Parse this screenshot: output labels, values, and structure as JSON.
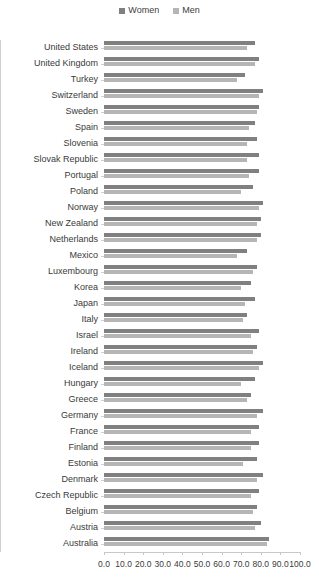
{
  "legend": {
    "position": "top-center",
    "entries": [
      {
        "label": "Women",
        "color": "#808080",
        "marker": "square-swatch"
      },
      {
        "label": "Men",
        "color": "#b5b5b5",
        "marker": "square-swatch"
      }
    ]
  },
  "axis": {
    "x_ticks": [
      "0.0",
      "10.0",
      "20.0",
      "30.0",
      "40.0",
      "50.0",
      "60.0",
      "70.0",
      "80.0",
      "90.0",
      "100.0"
    ]
  },
  "chart_data": {
    "type": "bar",
    "orientation": "horizontal",
    "title": "",
    "subtitle": "",
    "xlabel": "",
    "ylabel": "",
    "xlim": [
      0,
      100
    ],
    "xticks": [
      0,
      10,
      20,
      30,
      40,
      50,
      60,
      70,
      80,
      90,
      100
    ],
    "grid": false,
    "legend_position": "top-center",
    "categories": [
      "United States",
      "United Kingdom",
      "Turkey",
      "Switzerland",
      "Sweden",
      "Spain",
      "Slovenia",
      "Slovak Republic",
      "Portugal",
      "Poland",
      "Norway",
      "New Zealand",
      "Netherlands",
      "Mexico",
      "Luxembourg",
      "Korea",
      "Japan",
      "Italy",
      "Israel",
      "Ireland",
      "Iceland",
      "Hungary",
      "Greece",
      "Germany",
      "France",
      "Finland",
      "Estonia",
      "Denmark",
      "Czech Republic",
      "Belgium",
      "Austria",
      "Australia"
    ],
    "series": [
      {
        "name": "Women",
        "color": "#808080",
        "values": [
          77.0,
          79.0,
          72.0,
          81.0,
          79.0,
          77.0,
          78.0,
          79.0,
          79.0,
          76.0,
          81.0,
          80.0,
          80.0,
          73.0,
          78.0,
          75.0,
          77.0,
          73.0,
          79.0,
          78.0,
          81.0,
          77.0,
          75.0,
          81.0,
          79.0,
          79.0,
          78.0,
          81.0,
          79.0,
          78.0,
          80.0,
          84.0
        ]
      },
      {
        "name": "Men",
        "color": "#b5b5b5",
        "values": [
          73.0,
          77.0,
          68.0,
          79.0,
          78.0,
          74.0,
          73.0,
          73.0,
          74.0,
          70.0,
          79.0,
          78.0,
          78.0,
          68.0,
          76.0,
          70.0,
          72.0,
          71.0,
          75.0,
          76.0,
          79.0,
          70.0,
          73.0,
          78.0,
          75.0,
          75.0,
          71.0,
          78.0,
          75.0,
          76.0,
          77.0,
          83.0
        ]
      }
    ]
  }
}
